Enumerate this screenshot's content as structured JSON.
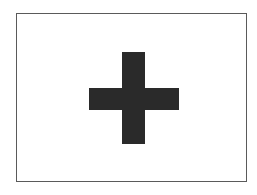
{
  "figure": {
    "frame": {
      "border_color": "#5a5a5a",
      "background": "#ffffff"
    },
    "icon": {
      "name": "plus-cross-icon",
      "color": "#2a2a2a"
    }
  }
}
